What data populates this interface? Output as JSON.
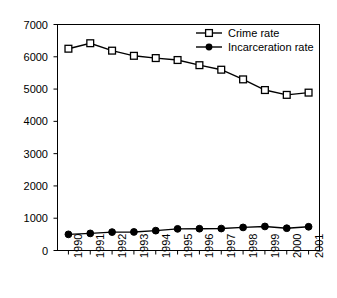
{
  "chart_data": {
    "type": "line",
    "title": "",
    "subtitle": "",
    "xlabel": "",
    "ylabel": "",
    "categories": [
      "1990",
      "1991",
      "1992",
      "1993",
      "1994",
      "1995",
      "1996",
      "1997",
      "1998",
      "1999",
      "2000",
      "2001"
    ],
    "series": [
      {
        "name": "Crime rate",
        "marker": "open-square",
        "color": "#000000",
        "values": [
          6250,
          6420,
          6190,
          6030,
          5960,
          5900,
          5740,
          5600,
          5300,
          4970,
          4820,
          4890
        ]
      },
      {
        "name": "Incarceration rate",
        "marker": "filled-circle",
        "color": "#000000",
        "values": [
          500,
          530,
          570,
          575,
          615,
          670,
          675,
          680,
          715,
          745,
          690,
          735
        ]
      }
    ],
    "ylim": [
      0,
      7000
    ],
    "yticks": [
      0,
      1000,
      2000,
      3000,
      4000,
      5000,
      6000,
      7000
    ],
    "ytick_labels": [
      "0",
      "1000",
      "2000",
      "3000",
      "4000",
      "5000",
      "6000",
      "7000"
    ],
    "grid": false,
    "legend_position": "top-right",
    "axis_color": "#000000",
    "background": "#ffffff"
  }
}
